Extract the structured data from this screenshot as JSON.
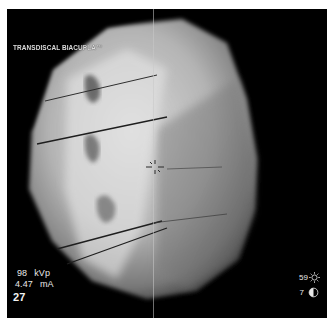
{
  "viewer": {
    "procedure_label": "TRANSDISCAL BIACUPLA™",
    "kvp_value": "98",
    "kvp_unit": "kVp",
    "ma_value": "4.47",
    "ma_unit": "mA",
    "frame_number": "27",
    "brightness_value": "59",
    "brightness_icon": "sun-icon",
    "contrast_value": "7",
    "contrast_icon": "contrast-half-circle-icon",
    "crosshair_icon": "target-crosshair-icon"
  },
  "colors": {
    "background": "#000000",
    "frame_border": "#ffffff",
    "overlay_text": "#e8e8e8"
  }
}
